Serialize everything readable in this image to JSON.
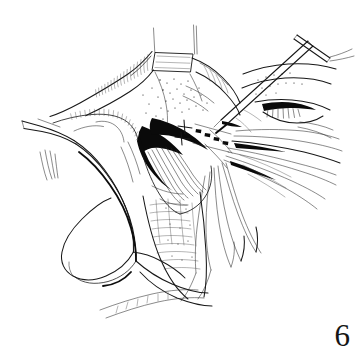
{
  "figure": {
    "kind": "line-art-medical-illustration",
    "caption_number": "6",
    "background_color": "#ffffff",
    "ink_color": "#151515",
    "shadow_color": "#0a0a0a",
    "width_px": 362,
    "height_px": 357,
    "technique": "pen-and-ink line drawing with stipple and hatch shading",
    "regions": [
      {
        "name": "retracted-tissue-flap-upper-left",
        "note": "broad tissue flap drawn with long contour strokes and fine hatching along its folded edge"
      },
      {
        "name": "stippled-tissue-field-center",
        "note": "dotted stipple texture indicating cut fascia surface"
      },
      {
        "name": "deep-shadow-incision",
        "note": "solid black wedge marking the depth of the opened wound"
      },
      {
        "name": "muscle-fiber-bundle",
        "note": "closely spaced parallel lines representing exposed muscle fibers"
      },
      {
        "name": "retractor-blade-left",
        "note": "curved loop retractor holding the wound edge open on the left"
      },
      {
        "name": "forceps-instrument-upper-right",
        "note": "straight shafted instrument with a cross bar handle entering from the top right"
      },
      {
        "name": "suture-strand-fan-right",
        "note": "fan of long thin suture threads sweeping off to the right margin"
      },
      {
        "name": "suture-strand-fan-lower",
        "note": "looping suture strands descending toward the lower margin"
      },
      {
        "name": "traction-sutures-top",
        "note": "two vertical traction threads rising off the top edge beside a pale gauze square"
      },
      {
        "name": "gauze-square-top",
        "note": "small white quadrilateral packing between the traction sutures"
      },
      {
        "name": "lower-tissue-margin",
        "note": "stippled and banded tissue sweeping toward the lower left corner"
      }
    ],
    "instruments": [
      {
        "name": "loop-retractor",
        "location": "left"
      },
      {
        "name": "straight-forceps",
        "location": "upper-right"
      },
      {
        "name": "traction-suture",
        "location": "top",
        "count": 2
      }
    ]
  }
}
